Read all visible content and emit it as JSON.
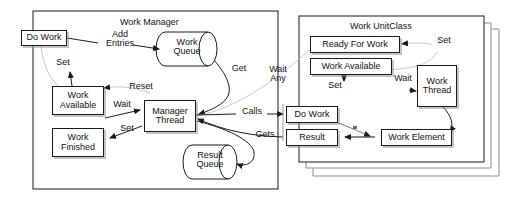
{
  "diagram": {
    "containers": [
      {
        "name": "work-manager",
        "label": "Work Manager"
      },
      {
        "name": "work-unitclass",
        "label": "Work UnitClass"
      }
    ],
    "manager_nodes": {
      "do_work": "Do Work",
      "work_queue": "Work\nQueue",
      "work_available": "Work\nAvailable",
      "work_finished": "Work\nFinished",
      "manager_thread": "Manager\nThread",
      "result_queue": "Result\nQueue"
    },
    "unit_nodes": {
      "ready_for_work": "Ready For Work",
      "work_available": "Work Available",
      "work_thread": "Work\nThread",
      "do_work": "Do Work",
      "result": "Result",
      "work_element": "Work Element"
    },
    "edge_labels": {
      "add_entries": "Add\nEntries",
      "set_left_top": "Set",
      "reset": "Reset",
      "wait_left": "Wait",
      "set_left_bottom": "Set",
      "get": "Get",
      "wait_any": "Wait\nAny",
      "calls": "Calls",
      "gets": "Gets",
      "set_right_top": "Set",
      "set_right_mid": "Set",
      "wait_right": "Wait"
    },
    "colors": {
      "stroke": "#1a1a1a",
      "faint_stroke": "#b4b4b4",
      "background": "#ffffff",
      "shadow": "#969696"
    },
    "stack_copies": 3
  }
}
